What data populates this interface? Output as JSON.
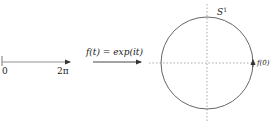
{
  "diagram": {
    "interval": {
      "start_label": "0",
      "end_label": "2π"
    },
    "map": {
      "label": "f(t) = exp(it)"
    },
    "circle": {
      "label": "S",
      "label_sup": "1",
      "point_label": "f(0)"
    },
    "colors": {
      "stroke": "#555555",
      "axis_dashed": "#888888",
      "text": "#222222"
    }
  }
}
